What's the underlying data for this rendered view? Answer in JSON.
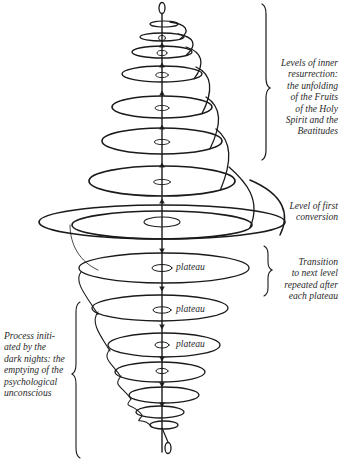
{
  "diagram": {
    "title": "",
    "stroke_color": "#1a1a1a",
    "background": "#ffffff",
    "annotations": {
      "levels_of_resurrection": "Levels of inner\nresurrection:\nthe unfolding\nof the Fruits\nof the Holy\nSpirit and the\nBeatitudes",
      "first_conversion": "Level of first\nconversion",
      "transition": "Transition\nto next level\nrepeated after\neach plateau",
      "dark_nights": "Process initi-\nated by the\ndark nights: the\nemptying of the\npsychological\nunconscious"
    },
    "plateaus": [
      {
        "label": "plateau"
      },
      {
        "label": "plateau"
      },
      {
        "label": "plateau"
      }
    ],
    "upper_loops_count": 8,
    "lower_loops_count": 7
  }
}
